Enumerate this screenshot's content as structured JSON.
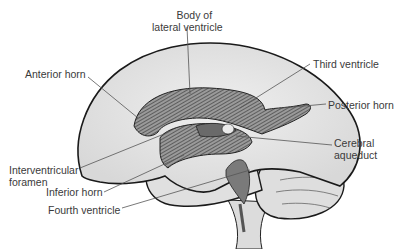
{
  "diagram": {
    "labels": {
      "body_lateral_1": "Body of",
      "body_lateral_2": "lateral ventricle",
      "anterior_horn": "Anterior horn",
      "third_ventricle": "Third ventricle",
      "posterior_horn": "Posterior horn",
      "cerebral_aqueduct_1": "Cerebral",
      "cerebral_aqueduct_2": "aqueduct",
      "interventricular_1": "Interventricular",
      "interventricular_2": "foramen",
      "inferior_horn": "Inferior horn",
      "fourth_ventricle": "Fourth ventricle"
    },
    "colors": {
      "brain_fill": "#e4e4e4",
      "outline": "#1a1a1a",
      "ventricle_fill": "#7a7a7a",
      "leader_line": "#555555"
    }
  }
}
